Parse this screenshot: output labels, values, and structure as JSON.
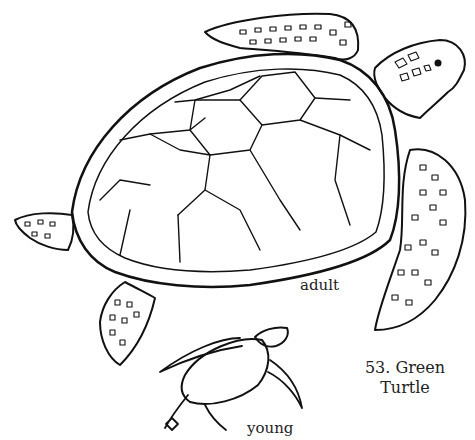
{
  "illustration": {
    "subject": "Green Turtle line drawing",
    "ink_color": "#111111",
    "background": "#ffffff"
  },
  "labels": {
    "adult": "adult",
    "young": "young",
    "title_line1": "53. Green",
    "title_line2": "Turtle"
  }
}
